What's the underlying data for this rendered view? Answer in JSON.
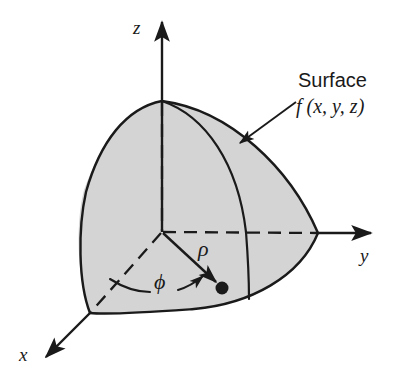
{
  "figure": {
    "background_color": "#ffffff",
    "line_color": "#1a1a1a",
    "surface_fill_color": "#d4d4d4",
    "axes": {
      "z_label": "z",
      "y_label": "y",
      "x_label": "x"
    },
    "annotations": {
      "surface_label": "Surface",
      "function_label": "f (x, y, z)",
      "radius_label": "ρ",
      "azimuth_label": "ϕ"
    },
    "geometry": {
      "origin": [
        162,
        232
      ],
      "z_axis_tip": [
        162,
        18
      ],
      "y_axis_tip": [
        376,
        233
      ],
      "x_axis_tip": [
        42,
        360
      ],
      "surface_apex": [
        162,
        101
      ],
      "surface_right_point": [
        318,
        233
      ],
      "surface_left_point": [
        84,
        252
      ],
      "surface_front_corner": [
        90,
        313
      ],
      "point_marker": [
        222,
        288
      ],
      "point_marker_radius": 6,
      "callout_arrow_start": [
        296,
        102
      ],
      "callout_arrow_tip": [
        236,
        146
      ]
    }
  }
}
